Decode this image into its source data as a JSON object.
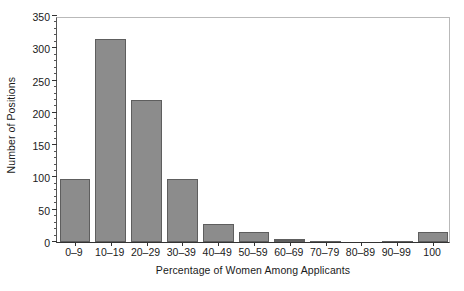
{
  "chart_data": {
    "type": "bar",
    "title": "",
    "xlabel": "Percentage of Women Among Applicants",
    "ylabel": "Number of Positions",
    "categories": [
      "0–9",
      "10–19",
      "20–29",
      "30–39",
      "40–49",
      "50–59",
      "60–69",
      "70–79",
      "80–89",
      "90–99",
      "100"
    ],
    "values": [
      98,
      314,
      220,
      98,
      28,
      15,
      4,
      2,
      0,
      2,
      15
    ],
    "ylim": [
      0,
      350
    ],
    "ytick_labels": [
      "0",
      "50",
      "100",
      "150",
      "200",
      "250",
      "300",
      "350"
    ],
    "ytick_values": [
      0,
      50,
      100,
      150,
      200,
      250,
      300,
      350
    ],
    "yminor_step": 10,
    "grid": false,
    "legend": false,
    "legend_position": "none",
    "bar_color": "#8c8c8c",
    "bar_edge_color": "#5e5e5e",
    "axis_color": "#333333",
    "frame_color": "#b9b9b9",
    "background": "#ffffff"
  }
}
